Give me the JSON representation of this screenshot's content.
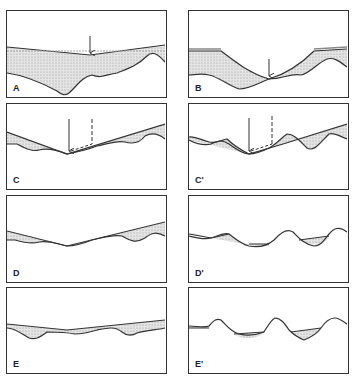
{
  "figure": {
    "panels": [
      {
        "id": "A",
        "label": "A"
      },
      {
        "id": "B",
        "label": "B"
      },
      {
        "id": "C",
        "label": "C"
      },
      {
        "id": "C_prime",
        "label": "C'"
      },
      {
        "id": "D",
        "label": "D"
      },
      {
        "id": "D_prime",
        "label": "D'"
      },
      {
        "id": "E",
        "label": "E"
      },
      {
        "id": "E_prime",
        "label": "E'"
      }
    ],
    "colors": {
      "line": "#333333",
      "fill": "#d8d8d8",
      "border": "#333333"
    }
  }
}
